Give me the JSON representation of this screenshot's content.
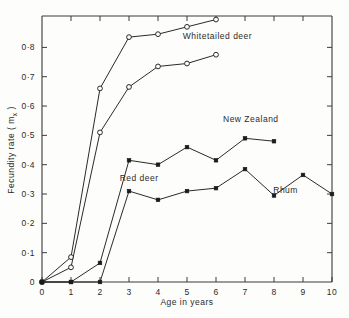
{
  "chart_data": {
    "type": "line",
    "title": "",
    "xlabel": "Age in years",
    "ylabel": "Fecundity rate ( m",
    "ylabel_sub": "x",
    "ylabel_tail": " )",
    "xlim": [
      0,
      10
    ],
    "ylim": [
      0,
      0.907
    ],
    "grid": false,
    "legend_position": "inline-annotations",
    "xticks": [
      0,
      1,
      2,
      3,
      4,
      5,
      6,
      7,
      8,
      9,
      10
    ],
    "xtick_labels": [
      "0",
      "1",
      "2",
      "3",
      "4",
      "5",
      "6",
      "7",
      "8",
      "9",
      "10"
    ],
    "yticks": [
      0,
      0.1,
      0.2,
      0.3,
      0.4,
      0.5,
      0.6,
      0.7,
      0.8
    ],
    "ytick_labels": [
      "0",
      "0·1",
      "0·2",
      "0·3",
      "0·4",
      "0·5",
      "0·6",
      "0·7",
      "0·8"
    ],
    "series": [
      {
        "name": "Whitetailed deer (upper)",
        "marker": "open-circle",
        "x": [
          0,
          1,
          2,
          3,
          4,
          5,
          6
        ],
        "values": [
          0.0,
          0.085,
          0.66,
          0.835,
          0.845,
          0.87,
          0.895
        ]
      },
      {
        "name": "Whitetailed deer (lower)",
        "marker": "open-circle",
        "x": [
          0,
          1,
          2,
          3,
          4,
          5,
          6
        ],
        "values": [
          0.0,
          0.05,
          0.51,
          0.665,
          0.735,
          0.745,
          0.775
        ]
      },
      {
        "name": "New Zealand",
        "marker": "filled-square",
        "x": [
          0,
          1,
          2,
          3,
          4,
          5,
          6,
          7,
          8
        ],
        "values": [
          0.0,
          0.0,
          0.065,
          0.415,
          0.4,
          0.46,
          0.415,
          0.49,
          0.48
        ]
      },
      {
        "name": "Rhum",
        "marker": "filled-square",
        "x": [
          0,
          1,
          2,
          3,
          4,
          5,
          6,
          7,
          8,
          9,
          10
        ],
        "values": [
          0.0,
          0.0,
          0.0,
          0.31,
          0.28,
          0.31,
          0.32,
          0.385,
          0.295,
          0.365,
          0.3
        ]
      }
    ],
    "annotations": [
      {
        "text": "Whitetailed  deer",
        "x": 6.05,
        "y": 0.83
      },
      {
        "text": "New Zealand",
        "x": 7.2,
        "y": 0.545
      },
      {
        "text": "Red deer",
        "x": 3.35,
        "y": 0.345
      },
      {
        "text": "Rhum",
        "x": 8.4,
        "y": 0.305
      }
    ]
  },
  "colors": {
    "background": "#fdfdfb",
    "axis": "#3a3a3a",
    "line": "#2a2a2a",
    "marker_fill": "#1a1a1a",
    "text": "#2b2b2b"
  }
}
